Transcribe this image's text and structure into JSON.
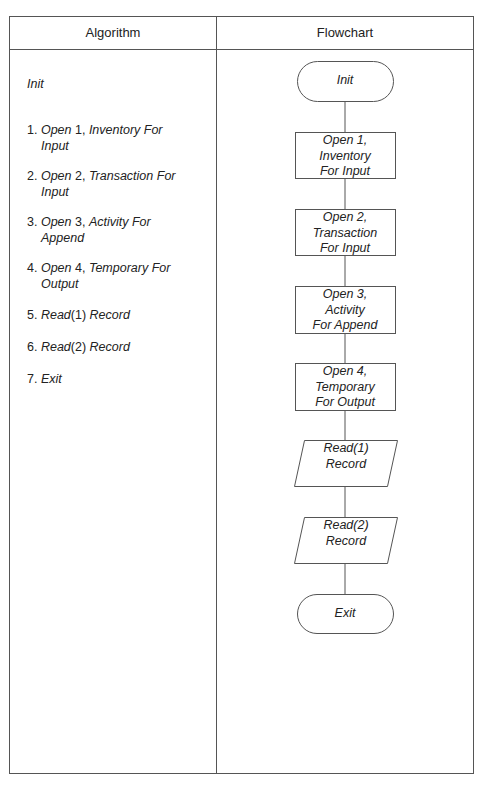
{
  "table": {
    "headers": {
      "algorithm": "Algorithm",
      "flowchart": "Flowchart"
    }
  },
  "algorithm": {
    "init": "Init",
    "steps": [
      {
        "num": "1.",
        "verb": "Open",
        "arg": " 1, ",
        "rest": "Inventory For",
        "cont": "Input"
      },
      {
        "num": "2.",
        "verb": "Open",
        "arg": " 2, ",
        "rest": "Transaction For",
        "cont": "Input"
      },
      {
        "num": "3.",
        "verb": "Open",
        "arg": " 3, ",
        "rest": "Activity For",
        "cont": "Append"
      },
      {
        "num": "4.",
        "verb": "Open",
        "arg": " 4, ",
        "rest": "Temporary For",
        "cont": "Output"
      },
      {
        "num": "5.",
        "verb": "Read",
        "arg": "(1) ",
        "rest": "Record",
        "cont": ""
      },
      {
        "num": "6.",
        "verb": "Read",
        "arg": "(2) ",
        "rest": "Record",
        "cont": ""
      },
      {
        "num": "7.",
        "verb": "Exit",
        "arg": "",
        "rest": "",
        "cont": ""
      }
    ]
  },
  "flowchart": {
    "nodes": [
      {
        "type": "terminator",
        "lines": [
          "Init"
        ]
      },
      {
        "type": "process",
        "lines": [
          "Open 1,",
          "Inventory",
          "For Input"
        ]
      },
      {
        "type": "process",
        "lines": [
          "Open 2,",
          "Transaction",
          "For Input"
        ]
      },
      {
        "type": "process",
        "lines": [
          "Open 3,",
          "Activity",
          "For Append"
        ]
      },
      {
        "type": "process",
        "lines": [
          "Open 4,",
          "Temporary",
          "For Output"
        ]
      },
      {
        "type": "io",
        "lines": [
          "Read(1)",
          "Record"
        ]
      },
      {
        "type": "io",
        "lines": [
          "Read(2)",
          "Record"
        ]
      },
      {
        "type": "terminator",
        "lines": [
          "Exit"
        ]
      }
    ]
  },
  "colors": {
    "line": "#555555",
    "text": "#222222",
    "background": "#ffffff"
  }
}
